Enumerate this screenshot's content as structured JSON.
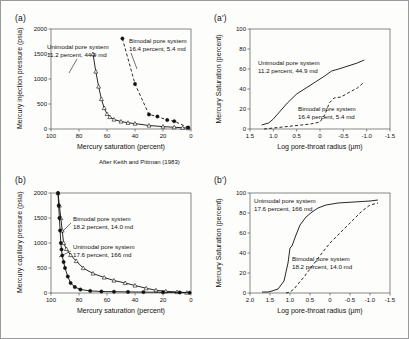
{
  "figure": {
    "background": "#fdfdfb",
    "border_color": "#9a9a9a",
    "credit": "After Keith and Pittman (1983)"
  },
  "labels": {
    "panel_a": "(a)",
    "panel_a_prime": "(a')",
    "panel_b": "(b)",
    "panel_b_prime": "(b')"
  },
  "chart_data": [
    {
      "id": "panel-a",
      "type": "line",
      "title": "",
      "panel_label": "(a)",
      "xlabel": "Mercury saturation (percent)",
      "ylabel": "Mercury injection pressure (psia)",
      "xlim": [
        100,
        0
      ],
      "ylim": [
        0,
        2000
      ],
      "xticks": [
        100,
        80,
        60,
        40,
        20,
        0
      ],
      "yticks": [
        0,
        500,
        1000,
        1500,
        2000
      ],
      "grid": false,
      "legend": "inline-annotation",
      "credit": "After Keith and Pittman (1983)",
      "series": [
        {
          "name": "Unimodal pore system",
          "annotation": "Unimodal pore system\n11.2 percent, 44.9 md",
          "porosity_percent": 11.2,
          "permeability_md": 44.9,
          "marker": "open-triangle",
          "line": "solid",
          "x": [
            70,
            68,
            66,
            64,
            62,
            60,
            58,
            55,
            50,
            45,
            40,
            30,
            20,
            12,
            6,
            2
          ],
          "y": [
            1500,
            1150,
            850,
            600,
            420,
            300,
            240,
            190,
            150,
            125,
            108,
            70,
            48,
            35,
            25,
            18
          ]
        },
        {
          "name": "Bimodal pore system",
          "annotation": "Bimodal pore system\n16.4 percent, 5.4 md",
          "porosity_percent": 16.4,
          "permeability_md": 5.4,
          "marker": "filled-circle",
          "line": "dashed",
          "x": [
            49,
            40,
            30,
            24,
            17,
            12,
            2
          ],
          "y": [
            1810,
            900,
            290,
            250,
            180,
            155,
            30
          ]
        }
      ]
    },
    {
      "id": "panel-a-prime",
      "type": "line",
      "title": "",
      "panel_label": "(a')",
      "xlabel": "Log pore-throat radius (µm)",
      "ylabel": "Mercury Saturation (percent)",
      "xlim": [
        1.5,
        -1.5
      ],
      "ylim": [
        0,
        100
      ],
      "xticks": [
        "1.5",
        "1.0",
        "0.5",
        "0",
        "-0.5",
        "-1.0",
        "-1.5"
      ],
      "yticks": [
        0,
        20,
        40,
        60,
        80,
        100
      ],
      "grid": false,
      "legend": "inline-annotation",
      "series": [
        {
          "name": "Unimodal pore system",
          "annotation": "Unimodal pore system\n11.2 percent, 44.9 md",
          "porosity_percent": 11.2,
          "permeability_md": 44.9,
          "line": "solid",
          "x": [
            1.25,
            1.1,
            1.0,
            0.85,
            0.7,
            0.5,
            0.3,
            0.1,
            -0.1,
            -0.25,
            -0.4,
            -0.6,
            -0.8,
            -0.95
          ],
          "y": [
            4,
            6,
            10,
            18,
            26,
            35,
            41,
            47,
            53,
            58,
            60,
            63,
            66,
            69
          ]
        },
        {
          "name": "Bimodal pore system",
          "annotation": "Bimodal pore system\n16.4 percent, 5.4 md",
          "porosity_percent": 16.4,
          "permeability_md": 5.4,
          "line": "dashed",
          "x": [
            1.2,
            1.0,
            0.8,
            0.6,
            0.4,
            0.2,
            0.1,
            0.0,
            -0.1,
            -0.2,
            -0.3,
            -0.45,
            -0.6,
            -0.8,
            -0.95
          ],
          "y": [
            0,
            1,
            2,
            3,
            4,
            5,
            6,
            7,
            14,
            26,
            31,
            32,
            36,
            41,
            47
          ]
        }
      ]
    },
    {
      "id": "panel-b",
      "type": "line",
      "title": "",
      "panel_label": "(b)",
      "xlabel": "Mercury saturation (percent)",
      "ylabel": "Mercury capillary pressure (psia)",
      "xlim": [
        100,
        0
      ],
      "ylim": [
        0,
        2000
      ],
      "xticks": [
        100,
        80,
        60,
        40,
        20,
        0
      ],
      "yticks": [
        0,
        500,
        1000,
        1500,
        2000
      ],
      "grid": false,
      "legend": "inline-annotation",
      "series": [
        {
          "name": "Bimodal pore system",
          "annotation": "Bimodal pore system\n18.2 percent, 14.0 md",
          "porosity_percent": 18.2,
          "permeability_md": 14.0,
          "marker": "open-triangle",
          "line": "solid",
          "x": [
            95,
            94,
            93,
            92,
            91,
            89,
            86,
            82,
            77,
            70,
            62,
            55,
            47,
            40,
            32,
            25,
            18,
            10,
            3
          ],
          "y": [
            2000,
            1750,
            1500,
            1250,
            1000,
            880,
            760,
            640,
            500,
            390,
            310,
            250,
            200,
            150,
            95,
            55,
            35,
            20,
            8
          ]
        },
        {
          "name": "Unimodal pore system",
          "annotation": "Unimodal pore system\n17.6 percent, 166 md",
          "porosity_percent": 17.6,
          "permeability_md": 166,
          "marker": "filled-circle",
          "line": "solid",
          "x": [
            95,
            94.5,
            94,
            93.5,
            93,
            92.5,
            92,
            91,
            90,
            88,
            86,
            83,
            79,
            72,
            64,
            55,
            45,
            34,
            20,
            8,
            1
          ],
          "y": [
            2000,
            1750,
            1500,
            1250,
            1000,
            870,
            750,
            620,
            500,
            330,
            200,
            120,
            70,
            42,
            30,
            26,
            22,
            18,
            14,
            10,
            6
          ]
        }
      ]
    },
    {
      "id": "panel-b-prime",
      "type": "line",
      "title": "",
      "panel_label": "(b')",
      "xlabel": "Log pore-throat radius (µm)",
      "ylabel": "Mercury Saturation (percent)",
      "xlim": [
        2.0,
        -1.5
      ],
      "ylim": [
        0,
        100
      ],
      "xticks": [
        "2.0",
        "1.5",
        "1.0",
        "0.5",
        "0",
        "-0.5",
        "-1.0",
        "-1.5"
      ],
      "yticks": [
        0,
        20,
        40,
        60,
        80,
        100
      ],
      "grid": false,
      "legend": "inline-annotation",
      "series": [
        {
          "name": "Unimodal pore system",
          "annotation": "Unimodal pore system\n17.6 percent, 166 md",
          "porosity_percent": 17.6,
          "permeability_md": 166,
          "line": "solid",
          "x": [
            1.7,
            1.55,
            1.45,
            1.3,
            1.15,
            1.05,
            1.0,
            0.95,
            0.85,
            0.75,
            0.6,
            0.45,
            0.3,
            0.1,
            -0.2,
            -0.6,
            -1.0,
            -1.2
          ],
          "y": [
            1,
            1,
            2,
            4,
            12,
            30,
            45,
            47,
            58,
            68,
            76,
            81,
            85,
            88,
            90,
            91,
            92,
            93
          ]
        },
        {
          "name": "Bimodal pore system",
          "annotation": "Bimodal pore system\n18.2 percent, 14.0 md",
          "porosity_percent": 18.2,
          "permeability_md": 14.0,
          "line": "dashed",
          "x": [
            1.1,
            1.0,
            0.9,
            0.8,
            0.65,
            0.5,
            0.35,
            0.2,
            0.0,
            -0.2,
            -0.4,
            -0.6,
            -0.8,
            -1.0,
            -1.2
          ],
          "y": [
            0,
            1,
            4,
            9,
            16,
            24,
            32,
            40,
            50,
            58,
            66,
            74,
            82,
            88,
            90
          ]
        }
      ]
    }
  ]
}
